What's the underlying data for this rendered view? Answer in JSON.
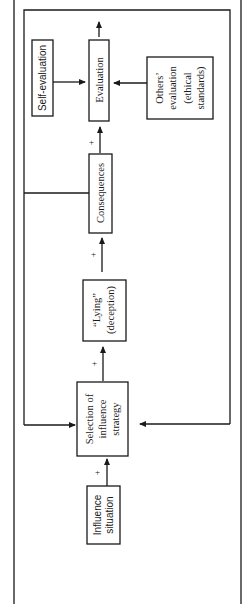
{
  "diagram": {
    "orientation": "rotated-90-ccw",
    "nodes": {
      "influence_situation": {
        "lines": [
          "Influence",
          "situation"
        ]
      },
      "selection_strategy": {
        "lines": [
          "Selection of",
          "influence",
          "strategy"
        ]
      },
      "lying": {
        "lines": [
          "“Lying”",
          "(deception)"
        ]
      },
      "consequences": {
        "lines": [
          "Consequences"
        ]
      },
      "evaluation": {
        "lines": [
          "Evaluation"
        ]
      },
      "self_evaluation": {
        "lines": [
          "Self-evaluation"
        ]
      },
      "others_evaluation": {
        "lines": [
          "Others’",
          "evaluation",
          "(ethical",
          "standards)"
        ]
      }
    },
    "edge_labels": {
      "influence_to_selection": "+",
      "selection_to_lying": "+",
      "lying_to_consequences": "+",
      "consequences_to_evaluation": "+"
    },
    "colors": {
      "stroke": "#1a1a1a",
      "background": "#ffffff"
    }
  }
}
